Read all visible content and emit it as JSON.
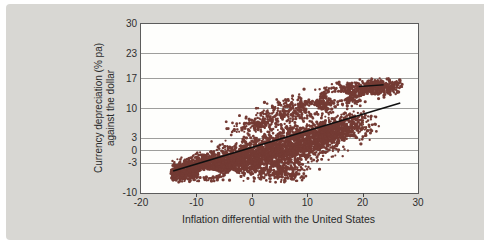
{
  "figure": {
    "page_bg": "#ffffff",
    "panel_bg": "#d8d7d3",
    "plot_bg": "#fefefc",
    "axis_color": "#5c5c5c",
    "grid_color": "#9e9e9c",
    "text_color": "#2a2a2a"
  },
  "chart_data": {
    "type": "scatter",
    "title": "",
    "xlabel": "Inflation differential with the United States",
    "ylabel_line1": "Currency depreciation (% pa)",
    "ylabel_line2": "against the dollar",
    "xlim": [
      -20,
      30
    ],
    "ylim": [
      -10,
      30
    ],
    "x_ticks": [
      -20,
      -10,
      0,
      10,
      20,
      30
    ],
    "y_ticks": [
      30,
      23,
      17,
      10,
      3,
      0,
      -3,
      -10
    ],
    "grid_y_values": [
      23,
      17,
      10,
      3,
      0,
      -3
    ],
    "x_tick_marks": [
      -10,
      0,
      10,
      20
    ],
    "grid_on": true,
    "legend": "none",
    "point_color": "#743b34",
    "point_radius_px": 1.25,
    "trend_line": {
      "x1": -14.2,
      "y1": -4.8,
      "x2": 26.8,
      "y2": 11.3,
      "color": "#101010",
      "width_px": 1.6
    },
    "annotation_dash": {
      "x1": 19.3,
      "y1": 15.2,
      "x2": 23.8,
      "y2": 15.6,
      "color": "#101010",
      "width_px": 1.4
    },
    "scatter_cloud": {
      "seed": 42,
      "bounds": {
        "xmin": -14.6,
        "xmax": 27.2,
        "ymin": -7.6,
        "ymax": 17.2
      },
      "clusters": [
        {
          "cx": -12.0,
          "cy": -4.3,
          "sx": 1.8,
          "sy": 1.1,
          "tilt": 0.3,
          "n": 420
        },
        {
          "cx": -8.5,
          "cy": -3.6,
          "sx": 2.2,
          "sy": 1.5,
          "tilt": 0.3,
          "n": 520
        },
        {
          "cx": -4.5,
          "cy": -2.8,
          "sx": 2.6,
          "sy": 1.7,
          "tilt": 0.3,
          "n": 560
        },
        {
          "cx": 0.0,
          "cy": -1.6,
          "sx": 3.0,
          "sy": 2.0,
          "tilt": 0.3,
          "n": 620
        },
        {
          "cx": 4.5,
          "cy": -0.2,
          "sx": 3.0,
          "sy": 2.2,
          "tilt": 0.3,
          "n": 620
        },
        {
          "cx": 9.0,
          "cy": 1.8,
          "sx": 2.8,
          "sy": 2.2,
          "tilt": 0.3,
          "n": 560
        },
        {
          "cx": 13.5,
          "cy": 3.8,
          "sx": 2.6,
          "sy": 2.0,
          "tilt": 0.3,
          "n": 480
        },
        {
          "cx": 17.5,
          "cy": 5.6,
          "sx": 2.2,
          "sy": 1.6,
          "tilt": 0.3,
          "n": 300
        },
        {
          "cx": 0.5,
          "cy": 6.2,
          "sx": 2.4,
          "sy": 1.0,
          "tilt": 0.1,
          "n": 150
        },
        {
          "cx": 8.0,
          "cy": 9.8,
          "sx": 3.0,
          "sy": 1.5,
          "tilt": 0.2,
          "n": 300
        },
        {
          "cx": 12.5,
          "cy": 11.3,
          "sx": 1.8,
          "sy": 1.2,
          "tilt": 0.2,
          "n": 150
        },
        {
          "cx": 18.0,
          "cy": 13.8,
          "sx": 2.8,
          "sy": 1.2,
          "tilt": 0.15,
          "n": 380
        },
        {
          "cx": 23.3,
          "cy": 14.9,
          "sx": 2.2,
          "sy": 1.0,
          "tilt": 0.15,
          "n": 280
        },
        {
          "cx": 5.5,
          "cy": -5.2,
          "sx": 2.6,
          "sy": 1.1,
          "tilt": 0.1,
          "n": 180
        },
        {
          "cx": -12.7,
          "cy": -5.6,
          "sx": 1.2,
          "sy": 0.7,
          "tilt": 0.2,
          "n": 100
        }
      ],
      "holes": [
        {
          "x": -7.8,
          "y": -5.3,
          "rx": 2.0,
          "ry": 0.9
        },
        {
          "x": -3.4,
          "y": -5.6,
          "rx": 1.3,
          "ry": 0.6
        },
        {
          "x": 15.6,
          "y": 13.0,
          "rx": 2.0,
          "ry": 1.0
        },
        {
          "x": 21.2,
          "y": 12.7,
          "rx": 1.7,
          "ry": 0.7
        },
        {
          "x": 11.0,
          "y": 13.2,
          "rx": 1.4,
          "ry": 1.3
        },
        {
          "x": 10.9,
          "y": 9.9,
          "rx": 1.1,
          "ry": 0.9
        },
        {
          "x": 18.0,
          "y": 1.8,
          "rx": 1.6,
          "ry": 1.0
        }
      ]
    }
  }
}
